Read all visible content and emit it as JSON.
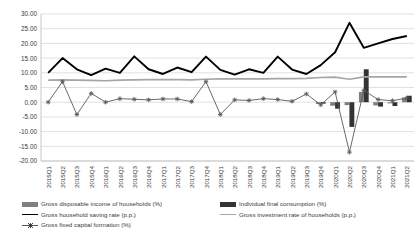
{
  "chart_data": {
    "type": "line",
    "title": "",
    "subtitle": "",
    "xlabel": "",
    "ylabel": "",
    "ylim": [
      -20,
      30
    ],
    "ytick_step": 5,
    "grid": true,
    "legend_position": "bottom",
    "ytick_labels": [
      "30.00",
      "25.00",
      "20.00",
      "15.00",
      "10.00",
      "5.00",
      "0.00",
      "-5.00",
      "-10.00",
      "-15.00",
      "-20.00"
    ],
    "categories": [
      "2015Q1",
      "2015Q2",
      "2015Q3",
      "2015Q4",
      "2016Q1",
      "2016Q2",
      "2016Q3",
      "2016Q4",
      "2017Q1",
      "2017Q2",
      "2017Q3",
      "2017Q4",
      "2018Q1",
      "2018Q2",
      "2018Q3",
      "2018Q4",
      "2019Q1",
      "2019Q2",
      "2019Q3",
      "2019Q4",
      "2020Q1",
      "2020Q2",
      "2020Q3",
      "2020Q4",
      "2021Q1",
      "2021Q2"
    ],
    "series": [
      {
        "name": "Gross disposable income of households (%)",
        "type": "bar",
        "color": "#7f7f7f",
        "values": [
          0.0,
          0.0,
          0.0,
          0.0,
          0.0,
          0.0,
          0.0,
          0.0,
          0.0,
          0.0,
          0.0,
          0.0,
          0.0,
          0.0,
          0.0,
          0.0,
          0.0,
          0.0,
          0.0,
          -0.6,
          -1.2,
          -1.0,
          3.5,
          -1.1,
          -0.4,
          1.6
        ]
      },
      {
        "name": "Individual final consumption (%)",
        "type": "bar",
        "color": "#333333",
        "values": [
          0.0,
          0.0,
          0.0,
          0.0,
          0.0,
          0.0,
          0.0,
          0.0,
          0.0,
          0.0,
          0.0,
          0.0,
          0.0,
          0.0,
          0.0,
          0.0,
          0.0,
          0.0,
          0.0,
          -0.5,
          -2.2,
          -8.4,
          11.2,
          -1.5,
          -1.3,
          2.2
        ]
      },
      {
        "name": "Gross household saving rate (p.p.)",
        "type": "line",
        "color": "#000000",
        "values": [
          10.0,
          15.0,
          11.2,
          9.2,
          11.4,
          10.0,
          15.6,
          11.2,
          9.6,
          11.8,
          10.2,
          15.5,
          11.0,
          9.4,
          11.2,
          10.0,
          15.5,
          11.1,
          9.6,
          12.6,
          17.0,
          27.0,
          18.5,
          20.0,
          21.5,
          22.5
        ]
      },
      {
        "name": "Gross investment rate of households (p.p.)",
        "type": "line",
        "color": "#a6a6a6",
        "values": [
          7.5,
          7.6,
          7.5,
          7.4,
          7.3,
          7.5,
          7.6,
          7.7,
          7.7,
          7.7,
          7.6,
          7.8,
          7.9,
          7.9,
          7.9,
          7.9,
          8.0,
          8.0,
          8.1,
          8.4,
          8.5,
          7.8,
          8.6,
          8.6,
          8.6,
          8.6
        ]
      },
      {
        "name": "Gross fixed capital formation (%)",
        "type": "line-marker",
        "color": "#595959",
        "values": [
          0.0,
          7.0,
          -4.2,
          3.0,
          0.0,
          1.2,
          1.0,
          0.8,
          1.1,
          1.1,
          0.2,
          7.0,
          -4.2,
          0.8,
          0.6,
          1.2,
          0.9,
          0.3,
          2.8,
          -0.9,
          3.5,
          -17.0,
          4.0,
          0.9,
          0.5,
          1.4
        ]
      }
    ]
  },
  "legend": {
    "items": [
      {
        "label": "Gross disposable income of households (%)",
        "marker": "bar-gray"
      },
      {
        "label": "Gross household saving rate (p.p.)",
        "marker": "line-black"
      },
      {
        "label": "Gross fixed capital formation (%)",
        "marker": "line-marker"
      },
      {
        "label": "Individual final consumption (%)",
        "marker": "bar-dark"
      },
      {
        "label": "Gross investment rate of households (p.p.)",
        "marker": "line-gray"
      }
    ]
  },
  "colors": {
    "bar_gray": "#7f7f7f",
    "bar_dark": "#333333",
    "line_black": "#000000",
    "line_gray": "#a6a6a6",
    "line_marker": "#595959",
    "grid": "#d9d9d9",
    "axis": "#bfbfbf",
    "text": "#3a3a3a"
  }
}
